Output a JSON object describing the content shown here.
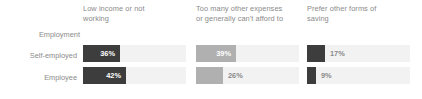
{
  "chart_data": {
    "type": "bar",
    "orientation": "horizontal",
    "title": "",
    "xlabel": "",
    "ylabel": "Employment",
    "axis_group_label": "Employment",
    "categories": [
      "Self-employed",
      "Employee"
    ],
    "panels": [
      {
        "header": "Low income or not\nworking",
        "values": [
          36,
          9
        ]
      }
    ],
    "series": [
      {
        "name": "Low income or not working",
        "values": [
          36,
          42
        ],
        "value_labels": [
          "36%",
          "42%"
        ],
        "color": "#3d3d3d"
      },
      {
        "name": "Too many other expenses or generally can't afford to",
        "values": [
          39,
          26
        ],
        "value_labels": [
          "39%",
          "26%"
        ],
        "color": "#b0b0b0"
      },
      {
        "name": "Prefer other forms of saving",
        "values": [
          17,
          9
        ],
        "value_labels": [
          "17%",
          "9%"
        ],
        "color": "#3d3d3d"
      }
    ],
    "xlim": [
      0,
      100
    ],
    "grid": false,
    "legend": "none",
    "track_color": "#f2f2f2",
    "text_color": "#8a8a8a"
  },
  "axis": {
    "group_label": "Employment",
    "row_labels": [
      "Self-employed",
      "Employee"
    ]
  },
  "columns": [
    {
      "header_line1": "Low income or not",
      "header_line2": "working",
      "bars": [
        {
          "value_label": "36%",
          "pct": 36,
          "color": "#3d3d3d",
          "label_position": "inside"
        },
        {
          "value_label": "42%",
          "pct": 42,
          "color": "#3d3d3d",
          "label_position": "inside"
        }
      ]
    },
    {
      "header_line1": "Too many other expenses",
      "header_line2": "or generally can't afford to",
      "bars": [
        {
          "value_label": "39%",
          "pct": 39,
          "color": "#b0b0b0",
          "label_position": "inside"
        },
        {
          "value_label": "26%",
          "pct": 26,
          "color": "#b0b0b0",
          "label_position": "outside"
        }
      ]
    },
    {
      "header_line1": "Prefer other forms of",
      "header_line2": "saving",
      "bars": [
        {
          "value_label": "17%",
          "pct": 17,
          "color": "#3d3d3d",
          "label_position": "outside"
        },
        {
          "value_label": "9%",
          "pct": 9,
          "color": "#3d3d3d",
          "label_position": "outside"
        }
      ]
    }
  ]
}
